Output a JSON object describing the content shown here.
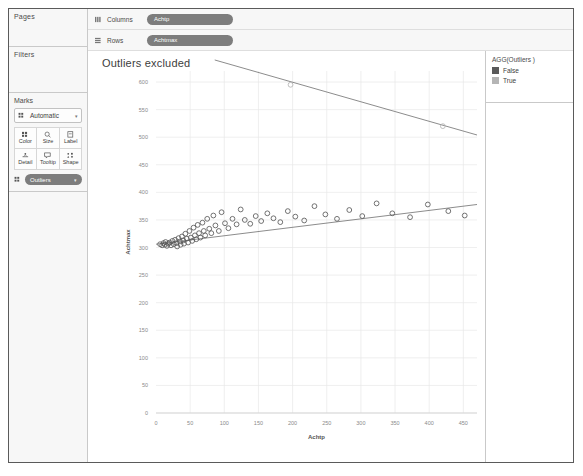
{
  "panels": {
    "pages_label": "Pages",
    "filters_label": "Filters",
    "marks_label": "Marks",
    "mark_type": "Automatic",
    "mark_buttons": [
      {
        "name": "color",
        "label": "Color"
      },
      {
        "name": "size",
        "label": "Size"
      },
      {
        "name": "label",
        "label": "Label"
      },
      {
        "name": "detail",
        "label": "Detail"
      },
      {
        "name": "tooltip",
        "label": "Tooltip"
      },
      {
        "name": "shape",
        "label": "Shape"
      }
    ],
    "marks_pill": "Outliers"
  },
  "shelves": [
    {
      "name": "Columns",
      "pill": "Achtp"
    },
    {
      "name": "Rows",
      "pill": "Achtmax"
    }
  ],
  "legend": {
    "title": "AGG(Outliers )",
    "items": [
      {
        "label": "False",
        "color": "#5a5a5a"
      },
      {
        "label": "True",
        "color": "#b5b5b5"
      }
    ]
  },
  "colors": {
    "pill": "#7d7d7d",
    "panel_bg": "#f7f7f7",
    "border": "#c9c9c9",
    "mark_false": "#5a5a5a",
    "mark_true": "#b5b5b5",
    "trend": "#6f6f6f",
    "grid": "#e8e8e8"
  },
  "chart_data": {
    "type": "scatter",
    "title": "Outliers excluded",
    "xlabel": "Achtp",
    "ylabel": "Achtmax",
    "xlim": [
      0,
      470
    ],
    "ylim": [
      0,
      620
    ],
    "xticks": [
      0,
      50,
      100,
      150,
      200,
      250,
      300,
      350,
      400,
      450
    ],
    "yticks": [
      0,
      50,
      100,
      150,
      200,
      250,
      300,
      350,
      400,
      450,
      500,
      550,
      600
    ],
    "grid": true,
    "legend_position": "right",
    "series": [
      {
        "name": "False",
        "color": "#5a5a5a",
        "marker": "open-circle",
        "points": [
          [
            6,
            306
          ],
          [
            9,
            304
          ],
          [
            11,
            308
          ],
          [
            13,
            305
          ],
          [
            14,
            310
          ],
          [
            16,
            303
          ],
          [
            18,
            307
          ],
          [
            20,
            309
          ],
          [
            22,
            304
          ],
          [
            24,
            312
          ],
          [
            26,
            306
          ],
          [
            28,
            314
          ],
          [
            30,
            308
          ],
          [
            31,
            302
          ],
          [
            33,
            317
          ],
          [
            35,
            311
          ],
          [
            36,
            305
          ],
          [
            38,
            320
          ],
          [
            40,
            313
          ],
          [
            41,
            307
          ],
          [
            43,
            325
          ],
          [
            45,
            316
          ],
          [
            47,
            309
          ],
          [
            49,
            330
          ],
          [
            51,
            318
          ],
          [
            53,
            312
          ],
          [
            55,
            336
          ],
          [
            57,
            322
          ],
          [
            59,
            315
          ],
          [
            61,
            341
          ],
          [
            63,
            326
          ],
          [
            65,
            318
          ],
          [
            68,
            345
          ],
          [
            70,
            330
          ],
          [
            72,
            322
          ],
          [
            75,
            352
          ],
          [
            78,
            334
          ],
          [
            81,
            326
          ],
          [
            84,
            358
          ],
          [
            87,
            340
          ],
          [
            92,
            330
          ],
          [
            96,
            364
          ],
          [
            101,
            344
          ],
          [
            106,
            335
          ],
          [
            112,
            352
          ],
          [
            118,
            342
          ],
          [
            124,
            369
          ],
          [
            130,
            350
          ],
          [
            138,
            343
          ],
          [
            146,
            357
          ],
          [
            154,
            348
          ],
          [
            163,
            362
          ],
          [
            172,
            353
          ],
          [
            182,
            346
          ],
          [
            193,
            366
          ],
          [
            204,
            356
          ],
          [
            217,
            349
          ],
          [
            232,
            375
          ],
          [
            248,
            360
          ],
          [
            265,
            352
          ],
          [
            283,
            368
          ],
          [
            302,
            357
          ],
          [
            323,
            380
          ],
          [
            346,
            362
          ],
          [
            372,
            355
          ],
          [
            398,
            378
          ],
          [
            428,
            366
          ],
          [
            452,
            358
          ]
        ]
      },
      {
        "name": "True",
        "color": "#b5b5b5",
        "marker": "open-circle",
        "points": [
          [
            197,
            595
          ],
          [
            420,
            520
          ]
        ]
      }
    ],
    "trendlines": [
      {
        "name": "trend-false",
        "from": [
          0,
          306
        ],
        "to": [
          470,
          378
        ],
        "color": "#6f6f6f"
      },
      {
        "name": "trend-true",
        "from": [
          86,
          640
        ],
        "to": [
          470,
          504
        ],
        "color": "#6f6f6f"
      }
    ]
  }
}
